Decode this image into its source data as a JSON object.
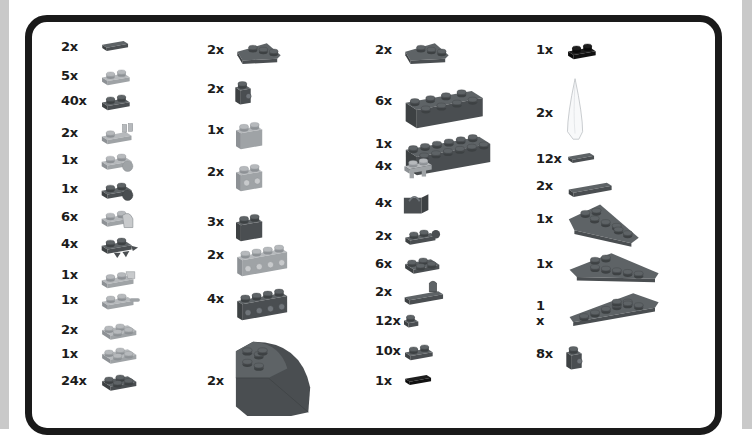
{
  "page": {
    "colors": {
      "frame": "#1a1a1a",
      "dark_bluish_gray": "#595d60",
      "light_bluish_gray": "#a5a8ab",
      "black": "#151515",
      "trans_clear": "#f4f6f8"
    }
  },
  "columns": [
    {
      "items": [
        {
          "qty": "2x",
          "part": "tile-1x2",
          "color": "dark_bluish_gray"
        },
        {
          "qty": "5x",
          "part": "plate-1x2",
          "color": "light_bluish_gray"
        },
        {
          "qty": "40x",
          "part": "plate-1x2",
          "color": "dark_bluish_gray"
        },
        {
          "qty": "2x",
          "part": "plate-1x2-with-clip",
          "color": "light_bluish_gray"
        },
        {
          "qty": "1x",
          "part": "plate-with-ball",
          "color": "light_bluish_gray"
        },
        {
          "qty": "1x",
          "part": "plate-with-ball",
          "color": "dark_bluish_gray"
        },
        {
          "qty": "6x",
          "part": "plate-with-clip-ring",
          "color": "light_bluish_gray"
        },
        {
          "qty": "4x",
          "part": "plate-with-spikes",
          "color": "dark_bluish_gray"
        },
        {
          "qty": "1x",
          "part": "plate-with-towball-socket",
          "color": "light_bluish_gray"
        },
        {
          "qty": "1x",
          "part": "plate-with-bar-handle",
          "color": "light_bluish_gray"
        },
        {
          "qty": "2x",
          "part": "plate-2x2-corner",
          "color": "light_bluish_gray"
        },
        {
          "qty": "1x",
          "part": "plate-2x2",
          "color": "light_bluish_gray"
        },
        {
          "qty": "24x",
          "part": "plate-2x2",
          "color": "dark_bluish_gray"
        }
      ]
    },
    {
      "items": [
        {
          "qty": "2x",
          "part": "wedge-plate-2x3",
          "color": "dark_bluish_gray"
        },
        {
          "qty": "2x",
          "part": "brick-1x1-with-stud",
          "color": "dark_bluish_gray"
        },
        {
          "qty": "1x",
          "part": "brick-1x2",
          "color": "light_bluish_gray"
        },
        {
          "qty": "2x",
          "part": "brick-1x2-studs-side",
          "color": "light_bluish_gray"
        },
        {
          "qty": "3x",
          "part": "brick-1x2",
          "color": "dark_bluish_gray"
        },
        {
          "qty": "2x",
          "part": "brick-1x4-studs-side",
          "color": "light_bluish_gray"
        },
        {
          "qty": "4x",
          "part": "brick-1x4-studs-side",
          "color": "dark_bluish_gray"
        },
        {
          "qty": "2x",
          "part": "wedge-round-corner",
          "color": "dark_bluish_gray"
        }
      ]
    },
    {
      "items": [
        {
          "qty": "2x",
          "part": "wedge-plate-2x3",
          "color": "dark_bluish_gray"
        },
        {
          "qty": "6x",
          "part": "brick-2x4",
          "color": "dark_bluish_gray"
        },
        {
          "qty": "1x",
          "part": "brick-2x6",
          "color": "dark_bluish_gray"
        },
        {
          "qty": "4x",
          "part": "plate-1x2-with-clips",
          "color": "light_bluish_gray"
        },
        {
          "qty": "4x",
          "part": "hinge-clip",
          "color": "dark_bluish_gray"
        },
        {
          "qty": "2x",
          "part": "plate-1x2-with-clip-end",
          "color": "dark_bluish_gray"
        },
        {
          "qty": "6x",
          "part": "plate-2x2",
          "color": "dark_bluish_gray"
        },
        {
          "qty": "2x",
          "part": "plate-1x4-with-handle",
          "color": "dark_bluish_gray"
        },
        {
          "qty": "12x",
          "part": "plate-1x1",
          "color": "dark_bluish_gray"
        },
        {
          "qty": "10x",
          "part": "plate-1x2-jumper",
          "color": "dark_bluish_gray"
        },
        {
          "qty": "1x",
          "part": "tile-1x2",
          "color": "black"
        }
      ]
    },
    {
      "items": [
        {
          "qty": "1x",
          "part": "plate-1x2",
          "color": "black"
        },
        {
          "qty": "2x",
          "part": "bar-tapered-horn",
          "color": "trans_clear"
        },
        {
          "qty": "12x",
          "part": "tile-1x2",
          "color": "dark_bluish_gray"
        },
        {
          "qty": "2x",
          "part": "tile-1x4",
          "color": "dark_bluish_gray"
        },
        {
          "qty": "1x",
          "part": "wedge-plate-3x6",
          "color": "dark_bluish_gray"
        },
        {
          "qty": "1x",
          "part": "wedge-plate-4x8-left",
          "color": "dark_bluish_gray"
        },
        {
          "qty": "1 x",
          "part": "wedge-plate-4x8-right",
          "color": "dark_bluish_gray"
        },
        {
          "qty": "8x",
          "part": "brick-1x1-with-stud",
          "color": "dark_bluish_gray"
        }
      ]
    }
  ]
}
